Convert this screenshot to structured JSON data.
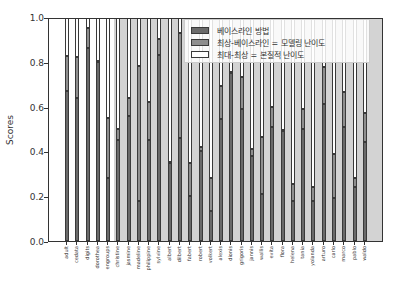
{
  "chart_data": {
    "type": "bar",
    "stacked": true,
    "title": "",
    "xlabel": "",
    "ylabel": "Scores",
    "ylim": [
      0.0,
      1.0
    ],
    "yticks": [
      "0.0",
      "0.2",
      "0.4",
      "0.6",
      "0.8",
      "1.0"
    ],
    "grid": false,
    "legend_position": "upper right",
    "categories": [
      "adult",
      "cedata",
      "digits",
      "dorothea",
      "engroups",
      "christine",
      "jasmine",
      "madeline",
      "philippine",
      "sylvine",
      "albert",
      "dilbert",
      "fabert",
      "robert",
      "volkert",
      "alexis",
      "dionis",
      "grigoris",
      "jannis",
      "wallis",
      "evita",
      "flora",
      "helena",
      "tania",
      "yolanda",
      "arturo",
      "carlo",
      "marco",
      "pablo",
      "waldo"
    ],
    "baseline": [
      0.67,
      0.64,
      0.86,
      0.8,
      0.28,
      0.45,
      0.56,
      0.18,
      0.45,
      0.83,
      0.35,
      0.46,
      0.2,
      0.4,
      0.135,
      0.545,
      0.75,
      0.59,
      0.38,
      0.21,
      0.51,
      0.49,
      0.18,
      0.5,
      0.18,
      0.61,
      0.19,
      0.51,
      0.24,
      0.44
    ],
    "best": [
      0.825,
      0.82,
      0.95,
      0.8,
      0.55,
      0.5,
      0.64,
      0.78,
      0.62,
      0.9,
      0.35,
      0.93,
      0.35,
      0.42,
      0.28,
      0.69,
      0.75,
      0.73,
      0.41,
      0.465,
      0.6,
      0.495,
      0.255,
      0.59,
      0.24,
      0.775,
      0.39,
      0.665,
      0.28,
      0.57
    ],
    "max": [
      1,
      1,
      1,
      1,
      1,
      1,
      1,
      1,
      1,
      1,
      1,
      1,
      1,
      1,
      1,
      1,
      1,
      1,
      1,
      1,
      1,
      1,
      1,
      1,
      1,
      1,
      1,
      1,
      1,
      1
    ],
    "series": [
      {
        "name": "베이스라인 방법",
        "key": "baseline",
        "color": "#6a6a6a"
      },
      {
        "name": "최상-베이스라인 = 모델링 난이도",
        "key": "best_minus_baseline",
        "color": "#8e8e8e"
      },
      {
        "name": "최대-최상 = 본질적 난이도",
        "key": "max_minus_best",
        "color": "#ffffff"
      }
    ]
  },
  "legend": {
    "items": [
      {
        "label": "베이스라인 방법",
        "color": "#6a6a6a"
      },
      {
        "label": "최상-베이스라인 = 모델링 난이도",
        "color": "#8e8e8e"
      },
      {
        "label": "최대-최상 = 본질적 난이도",
        "color": "#ffffff"
      }
    ]
  },
  "axes": {
    "ylabel": "Scores"
  }
}
